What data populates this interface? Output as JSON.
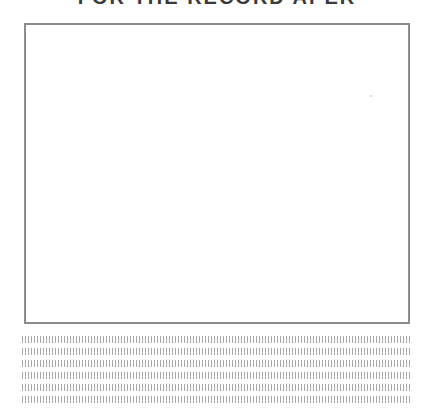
{
  "worksheet": {
    "title": "FOR THE RECORD APER",
    "title_note": "Title is clipped at the top edge; only the lower parts of the letters are visible, so this reading is a low-confidence guess.",
    "drawing_box": {
      "label": ""
    },
    "writing_lines": {
      "count": 6,
      "style": "dotted-tick",
      "rows": [
        "",
        "",
        "",
        "",
        "",
        ""
      ]
    }
  }
}
